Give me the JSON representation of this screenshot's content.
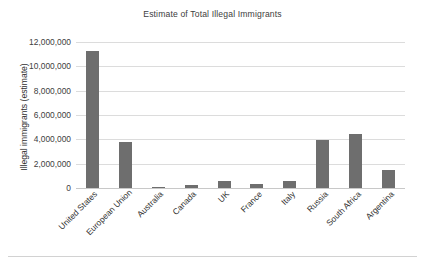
{
  "chart_data": {
    "type": "bar",
    "title": "Estimate of Total Illegal Immigrants",
    "xlabel": "",
    "ylabel": "Illegal immigrants (estimate)",
    "categories": [
      "United States",
      "European Union",
      "Australia",
      "Canada",
      "UK",
      "France",
      "Italy",
      "Russia",
      "South Africa",
      "Argentina"
    ],
    "values": [
      11300000,
      3780000,
      100000,
      250000,
      550000,
      300000,
      600000,
      3950000,
      4450000,
      1450000
    ],
    "ylim": [
      0,
      12000000
    ],
    "ytick_labels": [
      "0",
      "2,000,000",
      "4,000,000",
      "6,000,000",
      "8,000,000",
      "10,000,000",
      "12,000,000"
    ],
    "ytick_values": [
      0,
      2000000,
      4000000,
      6000000,
      8000000,
      10000000,
      12000000
    ],
    "grid": true,
    "legend": false,
    "legend_position": "none",
    "bar_color": "#6e6e6e",
    "gridline_color": "#dcdcdc",
    "background_color": "#ffffff"
  }
}
